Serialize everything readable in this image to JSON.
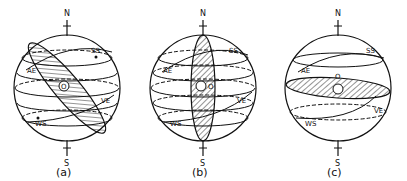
{
  "figure": {
    "type": "celestial-sphere-diagram",
    "panels": [
      {
        "id": "a",
        "caption": "(a)",
        "north_label": "N",
        "south_label": "S",
        "center_label": "O",
        "labels": {
          "ss": "SS",
          "ae": "AE",
          "ve": "VE",
          "ws": "WS"
        },
        "horizon_tilt_deg": 50
      },
      {
        "id": "b",
        "caption": "(b)",
        "north_label": "N",
        "south_label": "S",
        "center_label": "O",
        "labels": {
          "ss": "SS",
          "ae": "AE",
          "ve": "VE",
          "ws": "WS"
        },
        "horizon_tilt_deg": 90
      },
      {
        "id": "c",
        "caption": "(c)",
        "north_label": "N",
        "south_label": "S",
        "center_label": "O",
        "labels": {
          "ss": "SS",
          "ae": "AE",
          "ve": "VE",
          "ws": "WS"
        },
        "horizon_tilt_deg": 5
      }
    ],
    "colors": {
      "ink": "#111111",
      "background": "#ffffff"
    }
  }
}
